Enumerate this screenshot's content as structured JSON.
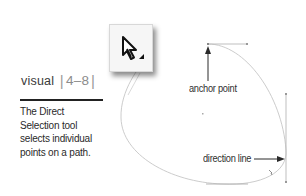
{
  "header": {
    "section_word": "visual",
    "separator": "|",
    "section_number": "4–8"
  },
  "caption": {
    "text": "The Direct Selection tool selects individual points on a path.",
    "lines": [
      "The Direct",
      "Selection tool",
      "selects individual",
      "points on a path."
    ]
  },
  "tool_icon": {
    "name": "direct-selection-tool",
    "glyph": "arrow-pointer-with-triangle"
  },
  "annotations": {
    "anchor_point": "anchor point",
    "direction_line": "direction line"
  },
  "colors": {
    "path": "#c4c4c4",
    "arrow": "#2a2a2a",
    "rule": "#222222",
    "text": "#2f2f2f"
  }
}
